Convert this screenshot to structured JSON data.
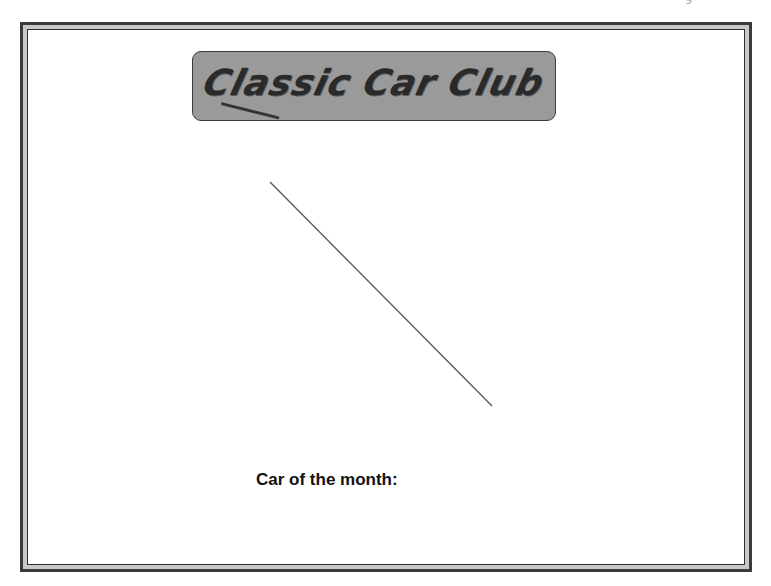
{
  "page": {
    "corner_mark": "9"
  },
  "banner": {
    "title": "Classic Car Club"
  },
  "image_placeholder": {
    "line": {
      "x1": 270,
      "y1": 182,
      "x2": 492,
      "y2": 406,
      "color": "#555555"
    }
  },
  "caption": {
    "label": "Car of the month:"
  },
  "colors": {
    "frame_dark": "#3a3a3a",
    "frame_band": "#c8c8c8",
    "banner_fill": "#9a9a9a",
    "banner_text": "#2a2a2a"
  }
}
